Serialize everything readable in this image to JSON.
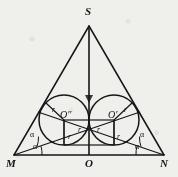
{
  "figure": {
    "type": "geometry-diagram",
    "stroke_color": "#16161a",
    "background_color": "#efefec",
    "vertices": {
      "apex": {
        "label": "S",
        "x": 89,
        "y": 26
      },
      "left": {
        "label": "M",
        "x": 14,
        "y": 155
      },
      "right": {
        "label": "N",
        "x": 164,
        "y": 155
      },
      "foot": {
        "label": "O",
        "x": 89,
        "y": 155
      }
    },
    "circles": [
      {
        "center_label": "O″",
        "cx": 64,
        "cy": 120,
        "r": 25,
        "side": "left"
      },
      {
        "center_label": "O′",
        "cx": 114,
        "cy": 120,
        "r": 25,
        "side": "right"
      }
    ],
    "radius_labels": [
      {
        "text": "r",
        "x": 55,
        "y": 110,
        "note": "left circle upper radius"
      },
      {
        "text": "r",
        "x": 70,
        "y": 131,
        "note": "left circle lower-right radius"
      },
      {
        "text": "r",
        "x": 57,
        "y": 134,
        "note": "left square side"
      },
      {
        "text": "r",
        "x": 104,
        "y": 131,
        "note": "right circle lower-left radius"
      },
      {
        "text": "r",
        "x": 121,
        "y": 134,
        "note": "right square side"
      },
      {
        "text": "r",
        "x": 124,
        "y": 110,
        "note": "right circle upper radius"
      }
    ],
    "angle_labels": [
      {
        "text": "α",
        "x": 31,
        "y": 133,
        "vertex": "M",
        "note": "upper bisected angle"
      },
      {
        "text": "α",
        "x": 33,
        "y": 145,
        "vertex": "M",
        "note": "lower bisected angle"
      },
      {
        "text": "α",
        "x": 140,
        "y": 133,
        "vertex": "N",
        "note": "upper bisected angle"
      },
      {
        "text": "α",
        "x": 137,
        "y": 145,
        "vertex": "N",
        "note": "lower bisected angle"
      }
    ],
    "segments": [
      {
        "name": "side-MS",
        "from": "M",
        "to": "S"
      },
      {
        "name": "side-SN",
        "from": "S",
        "to": "N"
      },
      {
        "name": "base-MN",
        "from": "M",
        "to": "N"
      },
      {
        "name": "altitude-SO",
        "from": "S",
        "to": "O"
      },
      {
        "name": "bisector-from-M",
        "from": "M",
        "through": "O″"
      },
      {
        "name": "bisector-from-N",
        "from": "N",
        "through": "O′"
      }
    ]
  }
}
